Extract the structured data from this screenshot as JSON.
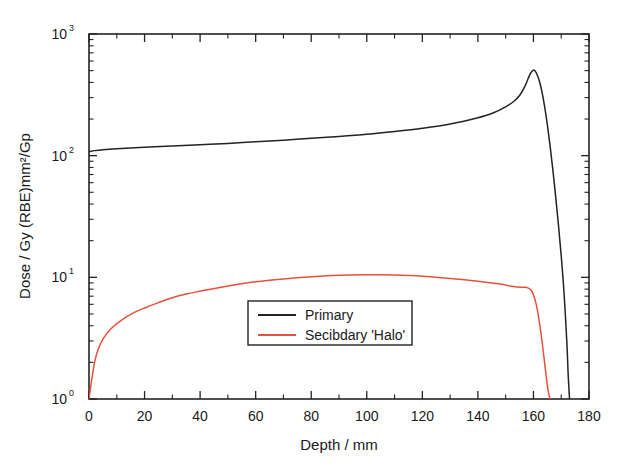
{
  "chart_data": {
    "type": "line",
    "title": "",
    "xlabel": "Depth / mm",
    "ylabel": "Dose / Gy (RBE)mm²/Gp",
    "xlim": [
      0,
      180
    ],
    "ylim": [
      1,
      1000
    ],
    "yscale": "log",
    "xscale": "linear",
    "grid": false,
    "xticks": [
      0,
      20,
      40,
      60,
      80,
      100,
      120,
      140,
      160,
      180
    ],
    "xticklabels": [
      "0",
      "20",
      "40",
      "60",
      "80",
      "100",
      "120",
      "140",
      "160",
      "180"
    ],
    "yticks": [
      1,
      10,
      100,
      1000
    ],
    "yticklabels": [
      "10⁰",
      "10¹",
      "10²",
      "10³"
    ],
    "ytick_mantissas": [
      "10",
      "10",
      "10",
      "10"
    ],
    "ytick_exponents": [
      "0",
      "1",
      "2",
      "3"
    ],
    "legend_position": "center",
    "series": [
      {
        "name": "Primary",
        "color": "#232323",
        "x": [
          0,
          2,
          5,
          10,
          20,
          30,
          40,
          50,
          60,
          70,
          80,
          90,
          100,
          110,
          120,
          130,
          140,
          145,
          150,
          153,
          155,
          157,
          158,
          159,
          160,
          160.5,
          161,
          162,
          163,
          164,
          165,
          166,
          167,
          168,
          169,
          170,
          171,
          172,
          172.5,
          173
        ],
        "values": [
          108,
          110,
          112,
          114,
          117,
          120,
          123,
          126,
          130,
          134,
          139,
          144,
          150,
          158,
          168,
          182,
          205,
          222,
          252,
          280,
          312,
          375,
          425,
          478,
          505,
          500,
          480,
          420,
          340,
          255,
          180,
          120,
          76,
          46,
          27,
          15,
          7.5,
          3.0,
          1.6,
          1.0
        ]
      },
      {
        "name": "Secibdary 'Halo'",
        "color": "#e8503c",
        "x": [
          0,
          1,
          2,
          3,
          5,
          8,
          12,
          16,
          20,
          25,
          30,
          35,
          40,
          50,
          60,
          70,
          80,
          90,
          100,
          105,
          110,
          115,
          120,
          130,
          140,
          148,
          152,
          155,
          157,
          158,
          159,
          160,
          161,
          162,
          163,
          164,
          165,
          165.5,
          166
        ],
        "values": [
          1.0,
          1.45,
          2.0,
          2.45,
          3.1,
          3.8,
          4.5,
          5.1,
          5.6,
          6.2,
          6.8,
          7.3,
          7.7,
          8.5,
          9.2,
          9.7,
          10.1,
          10.4,
          10.5,
          10.5,
          10.45,
          10.35,
          10.2,
          9.8,
          9.3,
          8.8,
          8.45,
          8.3,
          8.3,
          8.2,
          7.9,
          7.2,
          6.0,
          4.5,
          3.1,
          2.0,
          1.3,
          1.1,
          1.0
        ]
      }
    ],
    "legend": [
      {
        "label": "Primary",
        "color": "#232323"
      },
      {
        "label": "Secibdary 'Halo'",
        "color": "#e8503c"
      }
    ]
  },
  "colors": {
    "primary_series": "#232323",
    "halo_series": "#e8503c",
    "axis": "#232323",
    "background": "#ffffff"
  }
}
